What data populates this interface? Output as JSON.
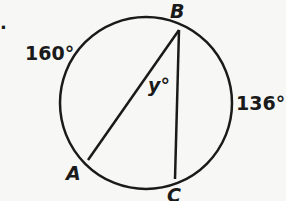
{
  "diagram": {
    "problem_marker": ".",
    "points": {
      "A": "A",
      "B": "B",
      "C": "C"
    },
    "arc_labels": {
      "arc_AB": "160°",
      "arc_BC": "136°"
    },
    "angle_label": "y°",
    "colors": {
      "stroke": "#1a1a1a",
      "background": "#f7f7f5"
    }
  }
}
